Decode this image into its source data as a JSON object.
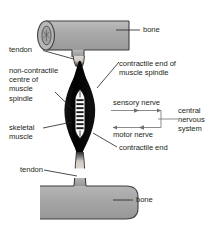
{
  "figure": {
    "colors": {
      "bone_fill": "#a8a8a8",
      "bone_outline": "#3b3b3b",
      "muscle_fill": "#0d0d0d",
      "spindle_fill": "#ffffff",
      "spindle_band": "#1a1a1a",
      "tendon_fill": "#d6d2cc",
      "leader_line": "#231f20",
      "arrow": "#6f6f6f",
      "text": "#231f20",
      "background": "#ffffff"
    }
  },
  "labels": {
    "bone_top": "bone",
    "bone_bottom": "bone",
    "tendon_top": "tendon",
    "tendon_bottom": "tendon",
    "non_contractile_centre": "non-contractile\ncentre of\nmuscle\nspindle",
    "contractile_end_of_muscle_spindle": "contractile end of\nmuscle spindle",
    "contractile_end": "contractile end",
    "skeletal_muscle": "skeletal\nmuscle",
    "sensory_nerve": "sensory nerve",
    "motor_nerve": "motor nerve",
    "central_nervous_system": "central\nnervous\nsystem"
  },
  "parts": {
    "bone_top_name": "bone-top",
    "bone_bottom_name": "bone-bottom",
    "tendon_top_name": "tendon-top",
    "tendon_bottom_name": "tendon-bottom",
    "muscle_name": "skeletal-muscle-body",
    "spindle_name": "muscle-spindle",
    "spindle_band_count": 8
  },
  "arrows": {
    "sensory": {
      "label": "sensory nerve",
      "direction": "right",
      "meaning": "muscle spindle to central nervous system"
    },
    "motor": {
      "label": "motor nerve",
      "direction": "left",
      "meaning": "central nervous system to muscle"
    }
  }
}
